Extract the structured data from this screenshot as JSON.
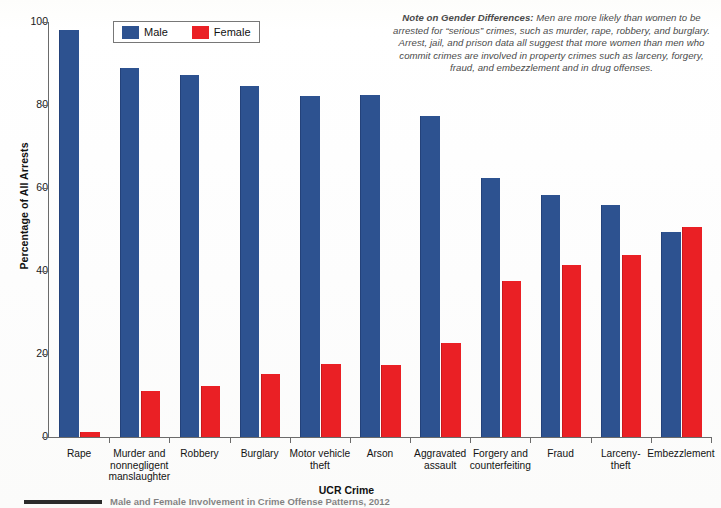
{
  "chart_data": {
    "type": "bar",
    "title": "",
    "xlabel": "UCR Crime",
    "ylabel": "Percentage of All Arrests",
    "ylim": [
      0,
      100
    ],
    "yticks": [
      0,
      20,
      40,
      60,
      80,
      100
    ],
    "grid": false,
    "legend_position": "top-left",
    "categories": [
      "Rape",
      "Murder and nonnegligent manslaughter",
      "Robbery",
      "Burglary",
      "Motor vehicle theft",
      "Arson",
      "Aggravated assault",
      "Forgery and counterfeiting",
      "Fraud",
      "Larceny-theft",
      "Embezzlement"
    ],
    "category_lines": [
      [
        "Rape"
      ],
      [
        "Murder and",
        "nonnegligent",
        "manslaughter"
      ],
      [
        "Robbery"
      ],
      [
        "Burglary"
      ],
      [
        "Motor vehicle",
        "theft"
      ],
      [
        "Arson"
      ],
      [
        "Aggravated",
        "assault"
      ],
      [
        "Forgery and",
        "counterfeiting"
      ],
      [
        "Fraud"
      ],
      [
        "Larceny-",
        "theft"
      ],
      [
        "Embezzlement"
      ]
    ],
    "series": [
      {
        "name": "Male",
        "color": "#2d5290",
        "values": [
          98.0,
          88.8,
          87.3,
          84.5,
          82.2,
          82.3,
          77.3,
          62.3,
          58.4,
          55.8,
          49.5
        ]
      },
      {
        "name": "Female",
        "color": "#ea2025",
        "values": [
          1.2,
          11.0,
          12.3,
          15.2,
          17.5,
          17.4,
          22.6,
          37.6,
          41.4,
          43.9,
          50.5
        ]
      }
    ]
  },
  "legend": {
    "items": [
      {
        "label": "Male",
        "color": "#2d5290"
      },
      {
        "label": "Female",
        "color": "#ea2025"
      }
    ]
  },
  "note": {
    "heading": "Note on Gender Differences:",
    "body": " Men are more likely than women to be arrested for “serious” crimes, such as murder, rape, robbery, and burglary. Arrest, jail, and prison data all suggest that more women than men who commit crimes are involved in property crimes such as larceny, forgery, fraud, and embezzlement and in drug offenses."
  },
  "footer": {
    "caption": "Male and Female Involvement in Crime Offense Patterns, 2012"
  },
  "colors": {
    "male": "#2d5290",
    "female": "#ea2025",
    "axis": "#6b6b6b",
    "text": "#131313"
  }
}
